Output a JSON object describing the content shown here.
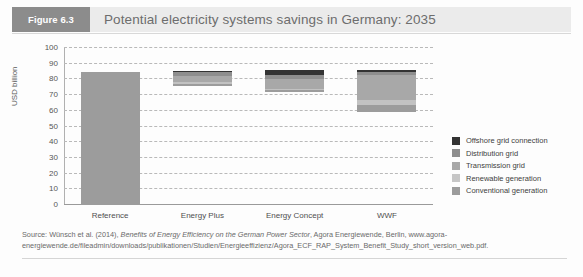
{
  "header": {
    "figure_badge": "Figure 6.3",
    "title": "Potential electricity systems savings in Germany: 2035"
  },
  "chart_data": {
    "type": "bar",
    "title": "Potential electricity systems savings in Germany: 2035",
    "xlabel": "",
    "ylabel": "USD billion",
    "ylim": [
      0,
      100
    ],
    "ytick_step": 10,
    "yticks": [
      0,
      10,
      20,
      30,
      40,
      50,
      60,
      70,
      80,
      90,
      100
    ],
    "grid": true,
    "legend_position": "right",
    "categories": [
      "Reference",
      "Energy Plus",
      "Energy Concept",
      "WWF"
    ],
    "series": [
      {
        "name": "Offshore grid connection",
        "color": "#333333",
        "segments": [
          {
            "category": "Reference",
            "from": 0,
            "to": 0
          },
          {
            "category": "Energy Plus",
            "from": 84.5,
            "to": 85.5
          },
          {
            "category": "Energy Concept",
            "from": 83.0,
            "to": 86.0
          },
          {
            "category": "WWF",
            "from": 84.5,
            "to": 86.0
          }
        ]
      },
      {
        "name": "Distribution grid",
        "color": "#8e8e8e",
        "segments": [
          {
            "category": "Reference",
            "from": 0,
            "to": 0
          },
          {
            "category": "Energy Plus",
            "from": 82.0,
            "to": 84.5
          },
          {
            "category": "Energy Concept",
            "from": 80.0,
            "to": 83.0
          },
          {
            "category": "WWF",
            "from": 83.0,
            "to": 84.5
          }
        ]
      },
      {
        "name": "Transmission grid",
        "color": "#a8a8a8",
        "segments": [
          {
            "category": "Reference",
            "from": 0,
            "to": 0
          },
          {
            "category": "Energy Plus",
            "from": 78.5,
            "to": 82.0
          },
          {
            "category": "Energy Concept",
            "from": 74.0,
            "to": 80.0
          },
          {
            "category": "WWF",
            "from": 67.0,
            "to": 83.0
          }
        ]
      },
      {
        "name": "Renewable generation",
        "color": "#c2c2c2",
        "segments": [
          {
            "category": "Reference",
            "from": 0,
            "to": 0
          },
          {
            "category": "Energy Plus",
            "from": 77.0,
            "to": 78.5
          },
          {
            "category": "Energy Concept",
            "from": 73.0,
            "to": 74.0
          },
          {
            "category": "WWF",
            "from": 64.0,
            "to": 67.0
          }
        ]
      },
      {
        "name": "Conventional generation",
        "color": "#9c9c9c",
        "segments": [
          {
            "category": "Reference",
            "from": 0,
            "to": 85.0
          },
          {
            "category": "Energy Plus",
            "from": 76.0,
            "to": 77.0
          },
          {
            "category": "Energy Concept",
            "from": 72.0,
            "to": 73.0
          },
          {
            "category": "WWF",
            "from": 59.5,
            "to": 64.0
          }
        ]
      }
    ]
  },
  "legend": {
    "items": [
      {
        "label": "Offshore grid connection",
        "color": "#333333"
      },
      {
        "label": "Distribution grid",
        "color": "#8e8e8e"
      },
      {
        "label": "Transmission grid",
        "color": "#a8a8a8"
      },
      {
        "label": "Renewable generation",
        "color": "#c6c6c6"
      },
      {
        "label": "Conventional generation",
        "color": "#9c9c9c"
      }
    ]
  },
  "source": {
    "prefix": "Source: Wünsch et al. (2014), ",
    "italic": "Benefits of Energy Efficiency on the German Power Sector",
    "suffix": ", Agora Energiewende, Berlin, www.agora-energiewende.de/fileadmin/downloads/publikationen/Studien/Energieeffizienz/Agora_ECF_RAP_System_Benefit_Study_short_version_web.pdf."
  }
}
